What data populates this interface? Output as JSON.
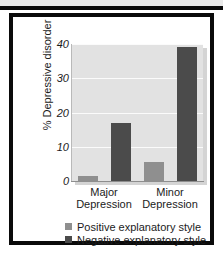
{
  "chart_data": {
    "type": "bar",
    "title": "",
    "xlabel": "",
    "ylabel": "% Depressive disorder",
    "categories": [
      "Major Depression",
      "Minor Depression"
    ],
    "category_lines": [
      {
        "line1": "Major",
        "line2": "Depression"
      },
      {
        "line1": "Minor",
        "line2": "Depression"
      }
    ],
    "series": [
      {
        "name": "Positive explanatory style",
        "color": "#8f8f8f",
        "values": [
          1.5,
          5.5
        ]
      },
      {
        "name": "Negative explanatory style",
        "color": "#4b4b4b",
        "values": [
          17,
          39
        ]
      }
    ],
    "ylim": [
      0,
      40
    ],
    "yticks": [
      0,
      10,
      20,
      30,
      40
    ],
    "ytick_labels": [
      "0",
      "10",
      "20",
      "30",
      "40"
    ],
    "grid": true,
    "legend_position": "bottom",
    "plot_background": "#e2e2e2",
    "gridline_color": "#fbfbfb"
  },
  "legend": {
    "entries": [
      {
        "label": "Positive explanatory style",
        "swatch": "positive"
      },
      {
        "label": "Negative explanatory style",
        "swatch": "negative"
      }
    ]
  }
}
